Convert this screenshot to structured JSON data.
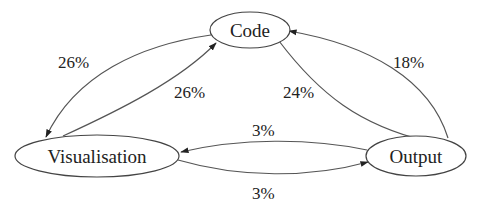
{
  "diagram": {
    "type": "state-transition-graph",
    "nodes": [
      {
        "id": "code",
        "label": "Code"
      },
      {
        "id": "visualisation",
        "label": "Visualisation"
      },
      {
        "id": "output",
        "label": "Output"
      }
    ],
    "edges": [
      {
        "from": "code",
        "to": "visualisation",
        "label": "26%"
      },
      {
        "from": "visualisation",
        "to": "code",
        "label": "26%"
      },
      {
        "from": "code",
        "to": "output",
        "label": "24%"
      },
      {
        "from": "output",
        "to": "code",
        "label": "18%"
      },
      {
        "from": "output",
        "to": "visualisation",
        "label": "3%"
      },
      {
        "from": "visualisation",
        "to": "output",
        "label": "3%"
      }
    ]
  }
}
